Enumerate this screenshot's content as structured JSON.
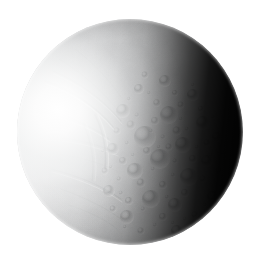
{
  "image": {
    "subject": "Enceladus",
    "type": "grayscale planetary disc photograph",
    "background_color": "#ffffff",
    "caption": "",
    "width": 267,
    "height": 258
  },
  "disc": {
    "name": "enceladus-disc",
    "center_x": 130,
    "center_y": 132,
    "diameter": 226,
    "base_color": "#d9dadb",
    "highlight_color": "#ffffff",
    "shadow_color": "#000000",
    "illumination_direction": "left",
    "terminator_side": "right",
    "phase_description": "gibbous, lit from the west"
  },
  "terrain": {
    "regions": [
      {
        "name": "smooth-grooved-plains",
        "location": "upper-left and left hemisphere",
        "description": "bright smooth plains crossed by curvilinear grooves, ridges and fractures",
        "tone": "very bright"
      },
      {
        "name": "cratered-terrain",
        "location": "center and lower-center",
        "description": "densely cratered ancient terrain with overlapping impact basins",
        "tone": "mid grey"
      },
      {
        "name": "terminator-shadow",
        "location": "right limb",
        "description": "unilluminated night side fading to black",
        "tone": "black"
      }
    ]
  },
  "labels": {
    "title": "",
    "credit": ""
  }
}
